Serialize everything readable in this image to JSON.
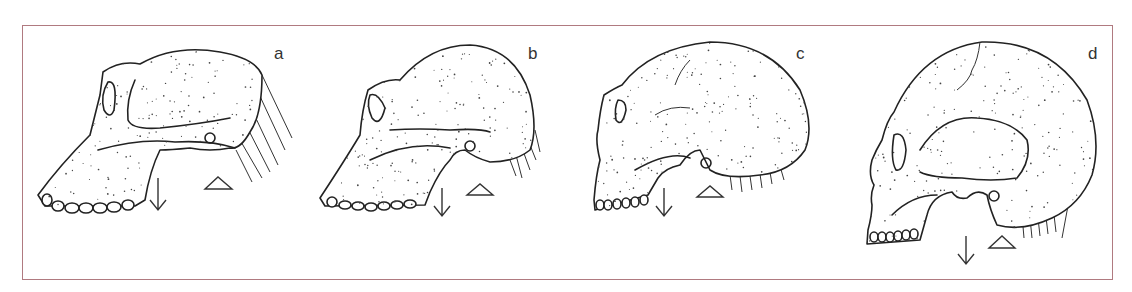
{
  "figure": {
    "frame_color": "#b07a80",
    "panels": [
      {
        "id": "a",
        "label": "a",
        "subject": "chimpanzee-skull"
      },
      {
        "id": "b",
        "label": "b",
        "subject": "homo-erectus-skull"
      },
      {
        "id": "c",
        "label": "c",
        "subject": "neanderthal-skull"
      },
      {
        "id": "d",
        "label": "d",
        "subject": "modern-human-skull"
      }
    ],
    "markers": {
      "arrow": "down-arrow",
      "triangle": "open-triangle"
    }
  }
}
